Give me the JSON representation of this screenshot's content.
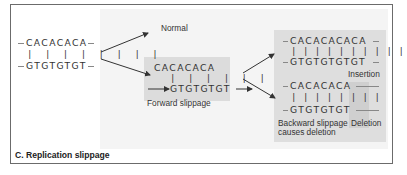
{
  "figure": {
    "title": "C. Replication slippage",
    "original": {
      "top_strand": "CACACACA",
      "bottom_strand": "GTGTGTGT"
    },
    "normal": {
      "label": "Normal"
    },
    "forward_slippage": {
      "top_strand": "CACACACA",
      "bottom_strand": "GTGTGTGT",
      "label": "Forward slippage"
    },
    "insertion": {
      "top_strand": "CACACACACA",
      "bottom_strand": "GTGTGTGTGT",
      "label": "Insertion"
    },
    "deletion": {
      "top_strand": "CACACACA",
      "bottom_strand": "GTGTGTGT",
      "label": "Deletion",
      "caption_line1": "Backward slippage",
      "caption_line2": "causes deletion"
    },
    "colors": {
      "frame": "#6b6b6b",
      "panel_bg": "#f4f4f4",
      "box_bg": "#dcdcdc",
      "text": "#333333"
    }
  }
}
